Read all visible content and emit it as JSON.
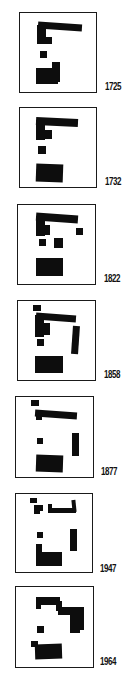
{
  "diagram": {
    "colors": {
      "building": "#0d0d0d",
      "frame": "#1a1a1a",
      "background": "#ffffff"
    },
    "panels": [
      {
        "year": "1725"
      },
      {
        "year": "1732"
      },
      {
        "year": "1822"
      },
      {
        "year": "1858"
      },
      {
        "year": "1877"
      },
      {
        "year": "1947"
      },
      {
        "year": "1964"
      }
    ]
  }
}
